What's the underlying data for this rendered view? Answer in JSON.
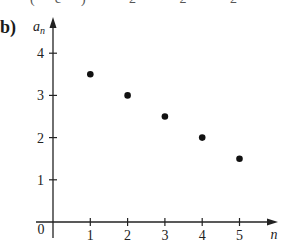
{
  "part_label": "b)",
  "top_residue": "(c)  2  2  2",
  "chart_data": {
    "type": "scatter",
    "title": "",
    "xlabel": "n",
    "ylabel": "a_n",
    "x": [
      1,
      2,
      3,
      4,
      5
    ],
    "series": [
      {
        "name": "a_n",
        "values": [
          3.5,
          3.0,
          2.5,
          2.0,
          1.5
        ]
      }
    ],
    "xticks": [
      "1",
      "2",
      "3",
      "4",
      "5"
    ],
    "yticks": [
      "1",
      "2",
      "3",
      "4"
    ],
    "origin_label": "0",
    "xlim": [
      0,
      6
    ],
    "ylim": [
      0,
      4.5
    ],
    "grid": false,
    "legend": "none"
  }
}
